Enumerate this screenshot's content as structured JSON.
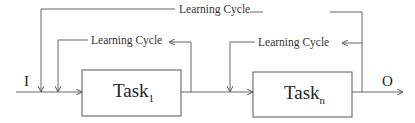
{
  "diagram": {
    "input_label": "I",
    "output_label": "O",
    "tasks": [
      {
        "name": "Task",
        "subscript": "1"
      },
      {
        "name": "Task",
        "subscript": "n"
      }
    ],
    "loops": [
      {
        "label": "Learning Cycle",
        "scope": "outer"
      },
      {
        "label": "Learning Cycle",
        "scope": "task-1"
      },
      {
        "label": "Learning Cycle",
        "scope": "task-n"
      }
    ],
    "colors": {
      "line": "#555555",
      "text": "#333333"
    }
  }
}
